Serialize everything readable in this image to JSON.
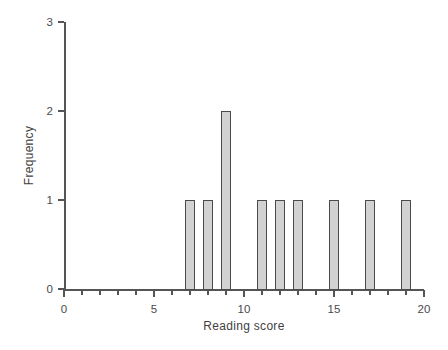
{
  "chart_data": {
    "type": "bar",
    "title": "",
    "subtitle": "",
    "xlabel": "Reading score",
    "ylabel": "Frequency",
    "xlim": [
      0,
      20
    ],
    "ylim": [
      0,
      3
    ],
    "grid": false,
    "legend": false,
    "legend_position": "none",
    "x_major_ticks": [
      0,
      5,
      10,
      15,
      20
    ],
    "x_major_tick_labels": [
      "0",
      "5",
      "10",
      "15",
      "20"
    ],
    "x_minor_ticks": [
      1,
      2,
      3,
      4,
      6,
      7,
      8,
      9,
      11,
      12,
      13,
      14,
      16,
      17,
      18,
      19
    ],
    "y_ticks": [
      0,
      1,
      2,
      3
    ],
    "y_tick_labels": [
      "0",
      "1",
      "2",
      "3"
    ],
    "bar_width": 0.6,
    "categories": [
      7,
      8,
      9,
      11,
      12,
      13,
      15,
      17,
      19
    ],
    "values": [
      1,
      1,
      2,
      1,
      1,
      1,
      1,
      1,
      1
    ],
    "bars": [
      {
        "x": 7,
        "y": 1,
        "label": "7"
      },
      {
        "x": 8,
        "y": 1,
        "label": "8"
      },
      {
        "x": 9,
        "y": 2,
        "label": "9"
      },
      {
        "x": 11,
        "y": 1,
        "label": "11"
      },
      {
        "x": 12,
        "y": 1,
        "label": "12"
      },
      {
        "x": 13,
        "y": 1,
        "label": "13"
      },
      {
        "x": 15,
        "y": 1,
        "label": "15"
      },
      {
        "x": 17,
        "y": 1,
        "label": "17"
      },
      {
        "x": 19,
        "y": 1,
        "label": "19"
      }
    ],
    "colors": {
      "bar_fill": "#d2d2d2",
      "bar_edge": "#4a4a4a",
      "axis": "#555555",
      "text": "#3f3f3f",
      "background": "#ffffff"
    }
  }
}
